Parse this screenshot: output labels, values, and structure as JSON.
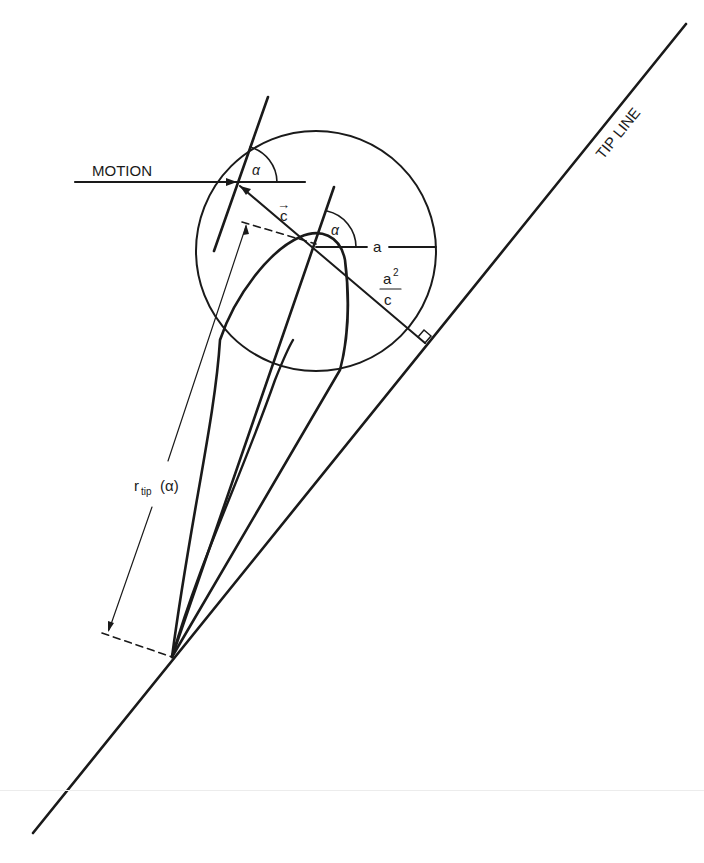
{
  "diagram": {
    "labels": {
      "motion": "MOTION",
      "tip_line": "TIP LINE",
      "alpha_top": "α",
      "alpha_center": "α",
      "c_vector": "c",
      "c_arrow": "→",
      "radius_a": "a",
      "a_squared_num": "a",
      "a_squared_exp": "2",
      "a_squared_den": "c",
      "r_tip_main": "r",
      "r_tip_sub": "tip",
      "r_tip_arg": "(α)"
    },
    "colors": {
      "ink": "#1a1a1a",
      "background": "#ffffff"
    },
    "geometry": {
      "circle_center": [
        316,
        251
      ],
      "circle_radius": 120,
      "tip_line_start": [
        33,
        833
      ],
      "tip_line_end": [
        686,
        24
      ],
      "convergence_point": [
        172,
        657
      ]
    }
  }
}
